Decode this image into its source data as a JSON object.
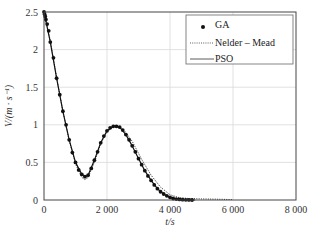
{
  "chart_data": {
    "type": "line",
    "title": "",
    "xlabel": "t/s",
    "ylabel": "V/(m · s⁻¹)",
    "xlim": [
      0,
      8000
    ],
    "ylim": [
      0,
      2.5
    ],
    "xticks": [
      0,
      2000,
      4000,
      6000,
      8000
    ],
    "xtick_labels": [
      "0",
      "2 000",
      "4 000",
      "6 000",
      "8 000"
    ],
    "yticks": [
      0,
      0.5,
      1,
      1.5,
      2,
      2.5
    ],
    "ytick_labels": [
      "0",
      "0.5",
      "1",
      "1.5",
      "2",
      "2.5"
    ],
    "grid": true,
    "legend_position": "upper right",
    "series": [
      {
        "name": "GA",
        "style": "markers",
        "x": [
          0,
          20,
          40,
          60,
          100,
          150,
          200,
          300,
          400,
          500,
          600,
          700,
          800,
          900,
          1000,
          1100,
          1200,
          1300,
          1400,
          1500,
          1600,
          1700,
          1800,
          1900,
          2000,
          2100,
          2200,
          2300,
          2400,
          2500,
          2600,
          2700,
          2800,
          2900,
          3000,
          3100,
          3200,
          3300,
          3400,
          3500,
          3600,
          3700,
          3800,
          3900,
          4000,
          4100,
          4200,
          4300,
          4400,
          4500,
          4600,
          4700
        ],
        "values": [
          2.5,
          2.47,
          2.44,
          2.4,
          2.34,
          2.25,
          2.1,
          1.89,
          1.62,
          1.4,
          1.18,
          1.0,
          0.8,
          0.63,
          0.5,
          0.4,
          0.34,
          0.31,
          0.33,
          0.42,
          0.53,
          0.64,
          0.76,
          0.85,
          0.92,
          0.96,
          0.98,
          0.98,
          0.97,
          0.93,
          0.87,
          0.8,
          0.72,
          0.64,
          0.55,
          0.47,
          0.39,
          0.32,
          0.26,
          0.2,
          0.15,
          0.11,
          0.08,
          0.055,
          0.035,
          0.02,
          0.012,
          0.007,
          0.004,
          0.002,
          0.001,
          0.0
        ]
      },
      {
        "name": "Nelder – Mead",
        "style": "dotted",
        "x": [
          0,
          200,
          400,
          600,
          800,
          1000,
          1200,
          1300,
          1400,
          1600,
          1800,
          2000,
          2200,
          2350,
          2500,
          2800,
          3100,
          3400,
          3700,
          4000,
          4300,
          4600,
          5000,
          5500,
          6000
        ],
        "values": [
          2.5,
          2.12,
          1.63,
          1.18,
          0.79,
          0.48,
          0.3,
          0.27,
          0.3,
          0.5,
          0.75,
          0.91,
          0.97,
          0.98,
          0.95,
          0.78,
          0.54,
          0.33,
          0.17,
          0.07,
          0.03,
          0.02,
          0.015,
          0.01,
          0.005
        ]
      },
      {
        "name": "PSO",
        "style": "solid",
        "x": [
          0,
          200,
          400,
          600,
          800,
          1000,
          1200,
          1300,
          1400,
          1600,
          1800,
          2000,
          2200,
          2300,
          2400,
          2600,
          2800,
          3000,
          3200,
          3400,
          3600,
          3800,
          4000,
          4200,
          4400,
          4600,
          4800
        ],
        "values": [
          2.5,
          2.1,
          1.62,
          1.18,
          0.8,
          0.5,
          0.34,
          0.31,
          0.33,
          0.53,
          0.76,
          0.92,
          0.98,
          0.98,
          0.97,
          0.87,
          0.72,
          0.55,
          0.39,
          0.26,
          0.15,
          0.08,
          0.035,
          0.012,
          0.004,
          0.001,
          0.0
        ]
      }
    ]
  },
  "legend": {
    "items": [
      {
        "label": "GA"
      },
      {
        "label": "Nelder – Mead"
      },
      {
        "label": "PSO"
      }
    ]
  },
  "colors": {
    "series": "#111111",
    "grid": "#d9d9d9",
    "frame": "#444444"
  }
}
